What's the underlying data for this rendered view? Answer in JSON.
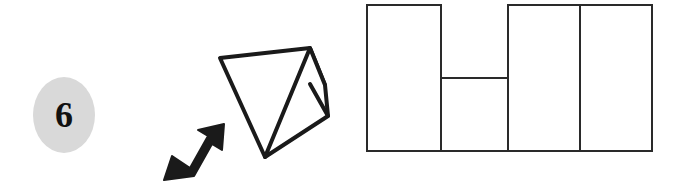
{
  "question": {
    "number": "6",
    "badge_color": "#d9d9d9",
    "ink_color": "#1a1a1a",
    "paper_color": "#ffffff"
  },
  "stimulus": {
    "name": "folded-paper-stimulus",
    "description": "folded sheet of paper with a small triangular flap folded over on the lower right, with a black arrow pointing at the fold from the lower left",
    "arrow": {
      "name": "fold-direction-arrow",
      "direction": "up-right"
    },
    "main_quad_points": "70,18 160,8 175,45 115,117",
    "flap_points": "160,8 175,45 115,117 178,75",
    "arrow_points": "12,112 40,84 34,78 62,70 56,98 50,92 22,120"
  },
  "answer_figure": {
    "name": "unfolded-pattern-figure",
    "description": "four adjoining rectangles sharing a common bottom edge; the second rectangle is shorter and starts lower",
    "rects": [
      {
        "name": "panel-1",
        "x": 12,
        "y": 5,
        "w": 74,
        "h": 146
      },
      {
        "name": "panel-2",
        "x": 86,
        "y": 78,
        "w": 68,
        "h": 73
      },
      {
        "name": "panel-3",
        "x": 153,
        "y": 5,
        "w": 72,
        "h": 146
      },
      {
        "name": "panel-4",
        "x": 225,
        "y": 5,
        "w": 72,
        "h": 146
      }
    ]
  }
}
